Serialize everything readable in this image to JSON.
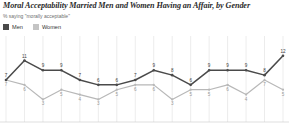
{
  "chart_title": "Moral Acceptability Married Men and Women Having an Affair, by Gender",
  "chart_subtitle": "% saying \"morally acceptable\"",
  "legend": {
    "items": [
      {
        "label": "Men",
        "color": "#4a4a4a",
        "swatch_name": "legend-swatch-men"
      },
      {
        "label": "Women",
        "color": "#c4c4c4",
        "swatch_name": "legend-swatch-women"
      }
    ]
  },
  "colors": {
    "men_line": "#4a4a4a",
    "women_line": "#b8b8b8",
    "grid": "#d8d8d8",
    "axis": "#c9c9c9",
    "title_text": "#2b2b2b",
    "subtitle_text": "#6e6e6e"
  },
  "chart_data": {
    "type": "line",
    "title": "Moral Acceptability Married Men and Women Having an Affair, by Gender",
    "subtitle": "% saying \"morally acceptable\"",
    "xlabel": "",
    "ylabel": "",
    "ylim": [
      0,
      14
    ],
    "grid": "vertical",
    "legend_position": "top-left",
    "categories": [
      "1",
      "2",
      "3",
      "4",
      "5",
      "6",
      "7",
      "8",
      "9",
      "10",
      "11",
      "12",
      "13",
      "14",
      "15",
      "16"
    ],
    "series": [
      {
        "name": "Men",
        "color": "#4a4a4a",
        "values": [
          7,
          11,
          9,
          9,
          7,
          6,
          6,
          7,
          9,
          8,
          6,
          9,
          9,
          9,
          8,
          12
        ]
      },
      {
        "name": "Women",
        "color": "#b8b8b8",
        "values": [
          7,
          6,
          3,
          5,
          4,
          3,
          5,
          6,
          6,
          3,
          5,
          5,
          6,
          4,
          7,
          5
        ]
      }
    ]
  }
}
